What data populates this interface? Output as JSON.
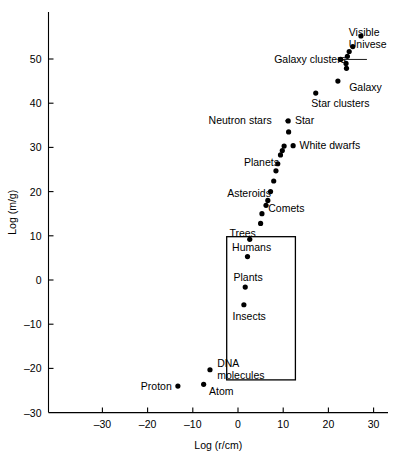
{
  "chart_data": {
    "type": "scatter",
    "title": "",
    "xlabel": "Log (r/cm)",
    "ylabel": "Log (m/g)",
    "xlim": [
      -38,
      34
    ],
    "ylim": [
      -30,
      56
    ],
    "xticks": [
      -30,
      -20,
      -10,
      0,
      10,
      20,
      30
    ],
    "xticklabels": [
      "–30",
      "–20",
      "–10",
      "0",
      "10",
      "20",
      "30"
    ],
    "yticks": [
      -30,
      -20,
      -10,
      0,
      10,
      20,
      30,
      40,
      50
    ],
    "yticklabels": [
      "–30",
      "–20",
      "–10",
      "0",
      "10",
      "20",
      "30",
      "40",
      "50"
    ],
    "grid": false,
    "legend": false,
    "points": [
      {
        "name": "proton",
        "x": -13.3,
        "y": -24.0
      },
      {
        "name": "atom",
        "x": -7.6,
        "y": -23.6
      },
      {
        "name": "dna-molecules",
        "x": -6.2,
        "y": -20.3
      },
      {
        "name": "insects",
        "x": 1.3,
        "y": -5.6
      },
      {
        "name": "plants",
        "x": 1.6,
        "y": -1.6
      },
      {
        "name": "humans",
        "x": 2.1,
        "y": 5.3
      },
      {
        "name": "trees",
        "x": 2.6,
        "y": 9.2
      },
      {
        "name": "comets-1",
        "x": 5.0,
        "y": 12.8
      },
      {
        "name": "comets-2",
        "x": 5.3,
        "y": 15.0
      },
      {
        "name": "comets-3",
        "x": 6.2,
        "y": 16.9
      },
      {
        "name": "asteroids-1",
        "x": 6.6,
        "y": 18.0
      },
      {
        "name": "asteroids-2",
        "x": 7.2,
        "y": 20.0
      },
      {
        "name": "asteroids-3",
        "x": 7.9,
        "y": 22.4
      },
      {
        "name": "planets-1",
        "x": 8.4,
        "y": 24.7
      },
      {
        "name": "planets-2",
        "x": 8.8,
        "y": 26.3
      },
      {
        "name": "planets-3",
        "x": 9.4,
        "y": 28.3
      },
      {
        "name": "planets-4",
        "x": 9.8,
        "y": 29.3
      },
      {
        "name": "white-dwarf-1",
        "x": 10.2,
        "y": 30.3
      },
      {
        "name": "white-dwarf-2",
        "x": 12.2,
        "y": 30.4
      },
      {
        "name": "star-lower",
        "x": 11.2,
        "y": 33.5
      },
      {
        "name": "star",
        "x": 11.1,
        "y": 36.0
      },
      {
        "name": "star-clusters",
        "x": 17.2,
        "y": 42.3
      },
      {
        "name": "galaxy",
        "x": 22.1,
        "y": 45.0
      },
      {
        "name": "galaxy-clusters",
        "x": 22.7,
        "y": 49.9
      },
      {
        "name": "gc-2",
        "x": 24.0,
        "y": 47.9
      },
      {
        "name": "gc-3",
        "x": 23.9,
        "y": 49.0
      },
      {
        "name": "gc-4",
        "x": 24.2,
        "y": 50.6
      },
      {
        "name": "gc-5",
        "x": 24.6,
        "y": 51.7
      },
      {
        "name": "gc-6",
        "x": 25.4,
        "y": 52.8
      },
      {
        "name": "visible-universe",
        "x": 27.2,
        "y": 55.2
      }
    ],
    "annotations": [
      {
        "name": "visible-universe-label",
        "text_line1": "Visible",
        "text_line2": "Univese",
        "x": 24.5,
        "y": 56.0,
        "anchor": "start",
        "two_line": true
      },
      {
        "name": "galaxy-clusters-label",
        "text": "Galaxy clusters",
        "x": 8.0,
        "y": 50.0,
        "anchor": "start",
        "leader": true,
        "leader_to_x": 22.7,
        "leader_to_y": 49.9
      },
      {
        "name": "galaxy-label",
        "text": "Galaxy",
        "x": 24.6,
        "y": 43.6,
        "anchor": "start"
      },
      {
        "name": "star-clusters-label",
        "text": "Star clusters",
        "x": 16.2,
        "y": 40.0,
        "anchor": "start"
      },
      {
        "name": "neutron-stars-label",
        "text": "Neutron stars",
        "x": -6.5,
        "y": 36.1,
        "anchor": "start",
        "leader": true,
        "leader_to_x": 11.1,
        "leader_to_y": 36.0
      },
      {
        "name": "star-label",
        "text": "Star",
        "x": 12.6,
        "y": 36.1,
        "anchor": "start"
      },
      {
        "name": "white-dwarfs-label",
        "text": "White dwarfs",
        "x": 13.6,
        "y": 30.5,
        "anchor": "start"
      },
      {
        "name": "planets-label",
        "text": "Planets",
        "x": 1.3,
        "y": 26.6,
        "anchor": "start"
      },
      {
        "name": "asteroids-label",
        "text": "Asteroids",
        "x": -2.4,
        "y": 19.6,
        "anchor": "start"
      },
      {
        "name": "comets-label",
        "text": "Comets",
        "x": 6.7,
        "y": 16.4,
        "anchor": "start"
      },
      {
        "name": "trees-label",
        "text": "Trees",
        "x": -1.9,
        "y": 10.7,
        "anchor": "start"
      },
      {
        "name": "humans-label",
        "text": "Humans",
        "x": -1.3,
        "y": 7.5,
        "anchor": "start"
      },
      {
        "name": "plants-label",
        "text": "Plants",
        "x": -1.0,
        "y": 0.6,
        "anchor": "start"
      },
      {
        "name": "insects-label",
        "text": "Insects",
        "x": -1.2,
        "y": -8.2,
        "anchor": "start"
      },
      {
        "name": "dna-label-line1",
        "text": "DNA",
        "x": -4.6,
        "y": -18.8,
        "anchor": "start"
      },
      {
        "name": "dna-label-line2",
        "text": "molecules",
        "x": -4.6,
        "y": -21.6,
        "anchor": "start"
      },
      {
        "name": "proton-label",
        "text": "Proton",
        "x": -21.5,
        "y": -24.0,
        "anchor": "start"
      },
      {
        "name": "atom-label",
        "text": "Atom",
        "x": -6.4,
        "y": -25.0,
        "anchor": "start"
      }
    ],
    "highlight_box": {
      "name": "life-forms-box",
      "x0": -2.5,
      "x1": 12.7,
      "y0": -22.6,
      "y1": 9.8,
      "contains": [
        "Trees",
        "Humans",
        "Plants",
        "Insects",
        "DNA molecules"
      ]
    }
  },
  "colors": {
    "axis": "#000000",
    "marker": "#000000",
    "background": "#ffffff",
    "box": "#000000"
  }
}
